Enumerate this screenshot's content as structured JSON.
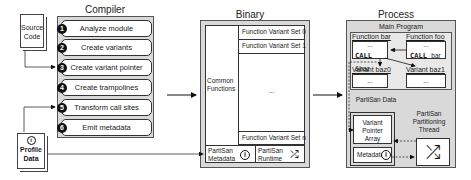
{
  "inputs": {
    "source_code": "Source Code",
    "profile_data": "Profile Data"
  },
  "compiler": {
    "title": "Compiler",
    "steps": [
      {
        "num": "1",
        "label": "Analyze module"
      },
      {
        "num": "2",
        "label": "Create variants"
      },
      {
        "num": "3",
        "label": "Create variant pointer array"
      },
      {
        "num": "4",
        "label": "Create trampolines"
      },
      {
        "num": "5",
        "label": "Transform call sites"
      },
      {
        "num": "6",
        "label": "Emit metadata"
      }
    ]
  },
  "binary": {
    "title": "Binary",
    "common_functions": "Common Functions",
    "variant_sets": [
      "Function Variant Set 0",
      "Function Variant Set 1",
      "...",
      "Function Variant Set n"
    ],
    "metadata": "PartiSan Metadata",
    "runtime": "PartiSan Runtime"
  },
  "process": {
    "title": "Process",
    "main_program": "Main Program",
    "function_bar": {
      "label": "Function bar",
      "dots": "...",
      "call": "CALL",
      "target": "&baz"
    },
    "function_foo": {
      "label": "Function foo",
      "dots": "...",
      "call": "CALL",
      "target": "bar"
    },
    "variant_bar0": {
      "label": "Variant baz0",
      "dots": "..."
    },
    "variant_bar1": {
      "label": "Variant baz1",
      "dots": "..."
    },
    "partisan_data": "PartiSan Data",
    "variant_pointer_array": "Variant Pointer Array",
    "metadata": "Metadata",
    "partitioning_thread": "PartiSan Partitioning Thread"
  },
  "icons": {
    "info": "i",
    "shuffle": "⤮"
  }
}
